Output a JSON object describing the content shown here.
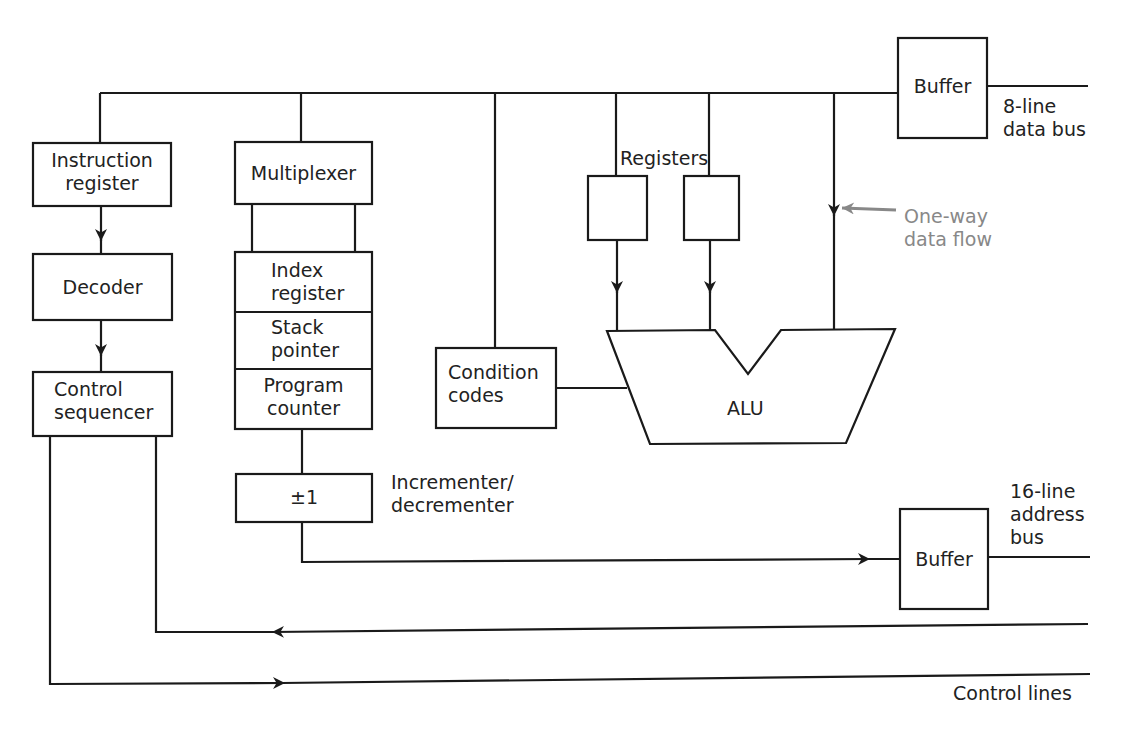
{
  "diagram": {
    "type": "microprocessor-block-diagram",
    "colors": {
      "line": "#1a1a1a",
      "annotation": "#888888",
      "background": "#ffffff"
    },
    "blocks": {
      "instruction_register": [
        "Instruction",
        "register"
      ],
      "decoder": "Decoder",
      "control_sequencer": [
        "Control",
        "sequencer"
      ],
      "multiplexer": "Multiplexer",
      "index_register": [
        "Index",
        "register"
      ],
      "stack_pointer": [
        "Stack",
        "pointer"
      ],
      "program_counter": [
        "Program",
        "counter"
      ],
      "incrementer": "±1",
      "condition_codes": [
        "Condition",
        "codes"
      ],
      "alu": "ALU",
      "registers_label": "Registers",
      "data_buffer": "Buffer",
      "address_buffer": "Buffer"
    },
    "labels": {
      "data_bus": [
        "8-line",
        "data bus"
      ],
      "address_bus": [
        "16-line",
        "address",
        "bus"
      ],
      "incrementer_label": [
        "Incrementer/",
        "decrementer"
      ],
      "one_way": [
        "One-way",
        "data flow"
      ],
      "control_lines": "Control lines"
    },
    "connections": [
      {
        "from": "data-bus",
        "to": "instruction_register"
      },
      {
        "from": "instruction_register",
        "to": "decoder",
        "arrow": true
      },
      {
        "from": "decoder",
        "to": "control_sequencer",
        "arrow": true
      },
      {
        "from": "data-bus",
        "to": "multiplexer"
      },
      {
        "from": "multiplexer",
        "to": "register-stack"
      },
      {
        "from": "program_counter",
        "to": "incrementer"
      },
      {
        "from": "incrementer",
        "to": "address_buffer",
        "arrow": true
      },
      {
        "from": "data-bus",
        "to": "condition_codes"
      },
      {
        "from": "condition_codes",
        "to": "alu"
      },
      {
        "from": "registers",
        "to": "alu",
        "arrow": true
      },
      {
        "from": "data-bus",
        "to": "alu",
        "arrow": true,
        "note": "one-way data flow"
      },
      {
        "from": "data_buffer",
        "to": "8-line data bus"
      },
      {
        "from": "control lines",
        "to": "control_sequencer",
        "arrow": true
      },
      {
        "from": "control_sequencer",
        "to": "control lines",
        "arrow": true
      }
    ]
  }
}
